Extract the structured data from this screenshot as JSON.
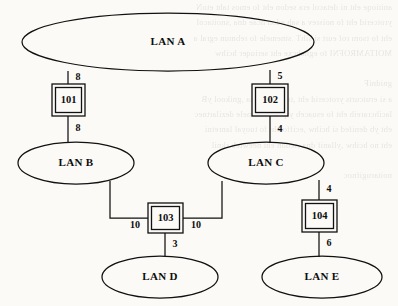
{
  "figure": {
    "paper_color": "#fbfaf7",
    "ink_color": "#111111"
  },
  "lans": [
    {
      "id": "lan-a",
      "label": "LAN A",
      "cx": 168,
      "cy": 42,
      "rx": 146,
      "ry": 29
    },
    {
      "id": "lan-b",
      "label": "LAN B",
      "cx": 76,
      "cy": 163,
      "rx": 58,
      "ry": 21
    },
    {
      "id": "lan-c",
      "label": "LAN C",
      "cx": 266,
      "cy": 163,
      "rx": 58,
      "ry": 21
    },
    {
      "id": "lan-d",
      "label": "LAN D",
      "cx": 160,
      "cy": 277,
      "rx": 58,
      "ry": 21
    },
    {
      "id": "lan-e",
      "label": "LAN E",
      "cx": 322,
      "cy": 277,
      "rx": 60,
      "ry": 21
    }
  ],
  "bridges": [
    {
      "id": "bridge-101",
      "label": "101",
      "x": 52,
      "y": 84,
      "w": 33,
      "h": 32
    },
    {
      "id": "bridge-102",
      "label": "102",
      "x": 252,
      "y": 84,
      "w": 36,
      "h": 32
    },
    {
      "id": "bridge-103",
      "label": "103",
      "x": 148,
      "y": 203,
      "w": 35,
      "h": 30
    },
    {
      "id": "bridge-104",
      "label": "104",
      "x": 302,
      "y": 200,
      "w": 35,
      "h": 32
    }
  ],
  "links": [
    {
      "id": "link-lana-101",
      "from": "lan-a",
      "to": "bridge-101",
      "path": "M 68 71 L 68 84"
    },
    {
      "id": "link-101-lanb",
      "from": "bridge-101",
      "to": "lan-b",
      "path": "M 68 116 L 68 143"
    },
    {
      "id": "link-lana-102",
      "from": "lan-a",
      "to": "bridge-102",
      "path": "M 270 70 L 270 84"
    },
    {
      "id": "link-102-lanc",
      "from": "bridge-102",
      "to": "lan-c",
      "path": "M 270 116 L 270 143"
    },
    {
      "id": "link-lanb-103",
      "from": "lan-b",
      "to": "bridge-103",
      "path": "M 110 181 L 110 218 L 148 218"
    },
    {
      "id": "link-lanc-103",
      "from": "lan-c",
      "to": "bridge-103",
      "path": "M 222 181 L 222 218 L 183 218"
    },
    {
      "id": "link-103-land",
      "from": "bridge-103",
      "to": "lan-d",
      "path": "M 165 233 L 165 257"
    },
    {
      "id": "link-lanc-104",
      "from": "lan-c",
      "to": "bridge-104",
      "path": "M 319 180 L 319 200"
    },
    {
      "id": "link-104-lane",
      "from": "bridge-104",
      "to": "lan-e",
      "path": "M 319 232 L 319 257"
    }
  ],
  "costs": [
    {
      "id": "cost-lana-101",
      "value": "8",
      "x": 78,
      "y": 78,
      "link": "link-lana-101"
    },
    {
      "id": "cost-101-lanb",
      "value": "8",
      "x": 78,
      "y": 129,
      "link": "link-101-lanb"
    },
    {
      "id": "cost-lana-102",
      "value": "5",
      "x": 280,
      "y": 77,
      "link": "link-lana-102"
    },
    {
      "id": "cost-102-lanc",
      "value": "4",
      "x": 280,
      "y": 130,
      "link": "link-102-lanc"
    },
    {
      "id": "cost-lanb-103",
      "value": "10",
      "x": 135,
      "y": 226,
      "link": "link-lanb-103"
    },
    {
      "id": "cost-lanc-103",
      "value": "10",
      "x": 196,
      "y": 226,
      "link": "link-lanc-103"
    },
    {
      "id": "cost-103-land",
      "value": "3",
      "x": 175,
      "y": 245,
      "link": "link-103-land"
    },
    {
      "id": "cost-lanc-104",
      "value": "4",
      "x": 329,
      "y": 190,
      "link": "link-lanc-104"
    },
    {
      "id": "cost-104-lane",
      "value": "6",
      "x": 329,
      "y": 244,
      "link": "link-104-lane"
    }
  ],
  "ghost_text": [
    "anitioqe eht ni detacol era sedon eht fo emos taht etoN",
    "yrotcerid eht fo noisrev a sah edon hcae dna ,snoitacol",
    "eht fo tsom rof eurt si sihT .stnemele fo rebmun egral a",
    "MOITAMROFNI fo egnahcxe eht seriuqer hcihw",
    "",
    "gnidniF",
    "a si erutcurts yrotcerid eht ,tsap eht ni sa ,gnikool yB",
    "lacihcrareih eht fo esuaceb ylpmis ,tnemele dezilartnec",
    "eht yb denifed si hcihw ,eciffo eht fo tuoyal lanretni",
    "eht no hcihw ,yllanif dna ,sedon eht neewteb sknil",
    "",
    "noitarugifnoc"
  ]
}
